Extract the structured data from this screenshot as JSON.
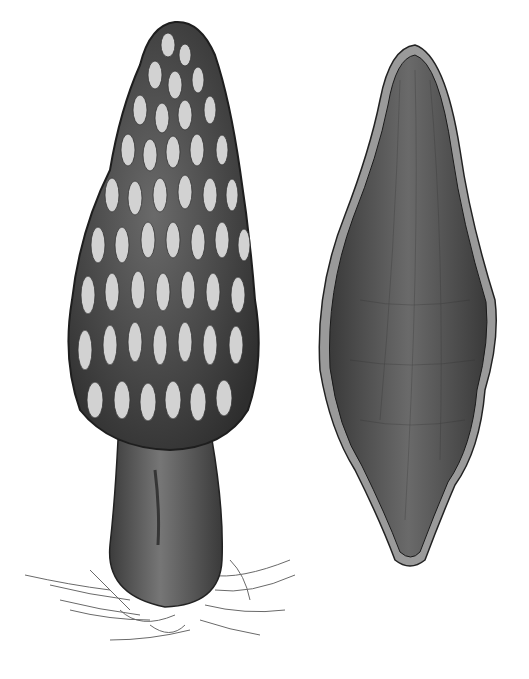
{
  "image": {
    "width": 529,
    "height": 679,
    "background": "#ffffff",
    "style": "grayscale ink and wash botanical illustration",
    "subjects": [
      {
        "name": "whole-morel-mushroom",
        "description": "Upright morel with conical honeycomb cap and thick stalk, root fibers at base",
        "cap_color_dark": "#3a3a3a",
        "cap_color_light": "#d8d8d8",
        "stem_color": "#5a5a5a"
      },
      {
        "name": "morel-cross-section",
        "description": "Longitudinal cross-section silhouette of morel, dark interior with pale rim",
        "interior_color": "#555555",
        "rim_color": "#9a9a9a"
      }
    ],
    "text_labels": []
  }
}
